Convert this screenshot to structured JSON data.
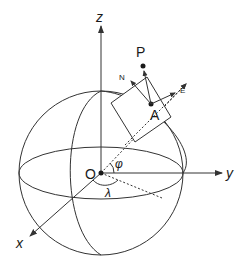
{
  "diagram": {
    "title": "",
    "colors": {
      "stroke": "#333333",
      "text": "#1a1a1a",
      "background": "#ffffff"
    },
    "labels": {
      "z_axis": "z",
      "y_axis": "y",
      "x_axis": "x",
      "origin": "O",
      "point_P": "P",
      "point_A": "A",
      "north": "N",
      "east": "E",
      "latitude": "φ",
      "longitude": "λ"
    }
  }
}
